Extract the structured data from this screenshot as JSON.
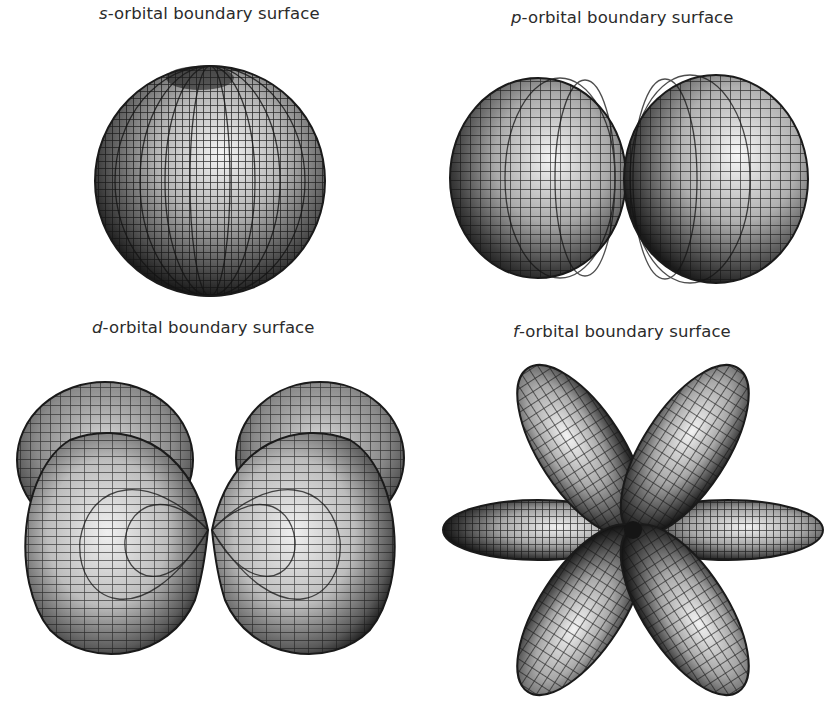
{
  "figure": {
    "background": "#ffffff",
    "mesh_color": "#1a1a1a",
    "shading": {
      "highlight": "#f2f2f2",
      "mid": "#9a9a9a",
      "shadow": "#1e1e1e"
    },
    "panels": [
      {
        "id": "s",
        "symbol": "s",
        "label_rest": "-orbital boundary surface",
        "shape": "sphere",
        "lobes": 1,
        "position": "top-left"
      },
      {
        "id": "p",
        "symbol": "p",
        "label_rest": "-orbital boundary surface",
        "shape": "dumbbell",
        "lobes": 2,
        "position": "top-right"
      },
      {
        "id": "d",
        "symbol": "d",
        "label_rest": "-orbital boundary surface",
        "shape": "double-lobed with rear lobes",
        "lobes": 4,
        "position": "bottom-left"
      },
      {
        "id": "f",
        "symbol": "f",
        "label_rest": "-orbital boundary surface",
        "shape": "six-lobed flower",
        "lobes": 6,
        "position": "bottom-right"
      }
    ]
  }
}
